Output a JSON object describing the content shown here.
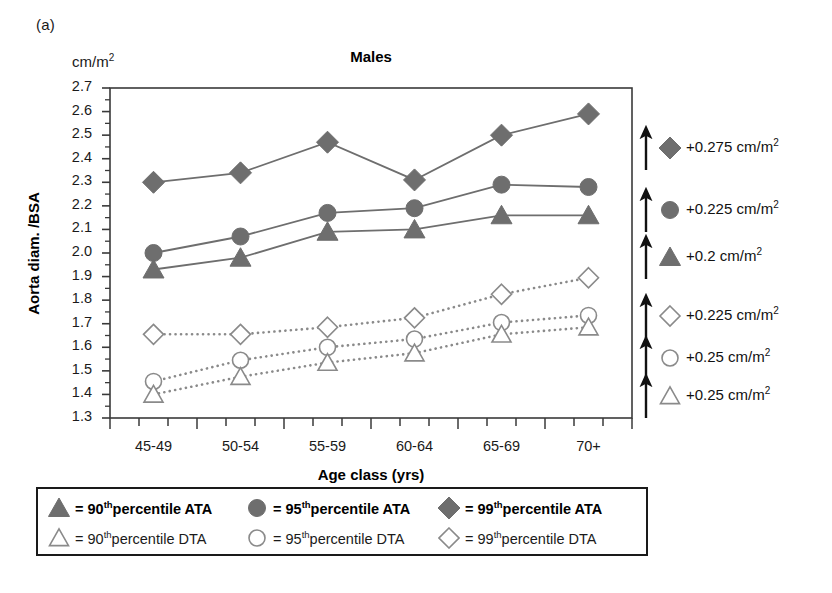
{
  "panel": {
    "label": "(a)"
  },
  "axes": {
    "unit_label": "cm/m",
    "unit_exponent": "2",
    "y_axis_title": "Aorta diam. /BSA",
    "x_axis_title": "Age class (yrs)"
  },
  "annotations": [
    {
      "marker": "diamond-filled",
      "text": "+0.275 cm/m",
      "exponent": "2",
      "arrow": "up-arrow-icon"
    },
    {
      "marker": "circle-filled",
      "text": "+0.225 cm/m",
      "exponent": "2",
      "arrow": "up-arrow-icon"
    },
    {
      "marker": "triangle-filled",
      "text": "+0.2 cm/m",
      "exponent": "2",
      "arrow": "up-arrow-icon"
    },
    {
      "marker": "diamond-open",
      "text": "+0.225 cm/m",
      "exponent": "2",
      "arrow": "up-arrow-icon"
    },
    {
      "marker": "circle-open",
      "text": "+0.25 cm/m",
      "exponent": "2",
      "arrow": "up-arrow-icon"
    },
    {
      "marker": "triangle-open",
      "text": "+0.25 cm/m",
      "exponent": "2",
      "arrow": "up-arrow-icon"
    }
  ],
  "legend": {
    "rows": [
      [
        {
          "marker": "triangle-filled",
          "eq": "=",
          "num": "90",
          "sup": "th",
          "rest": "percentile ATA"
        },
        {
          "marker": "circle-filled",
          "eq": "=",
          "num": "95",
          "sup": "th",
          "rest": "percentile ATA"
        },
        {
          "marker": "diamond-filled",
          "eq": "=",
          "num": "99",
          "sup": "th",
          "rest": "percentile ATA"
        }
      ],
      [
        {
          "marker": "triangle-open",
          "eq": "=",
          "num": "90",
          "sup": "th",
          "rest": "percentile DTA"
        },
        {
          "marker": "circle-open",
          "eq": "=",
          "num": "95",
          "sup": "th",
          "rest": "percentile DTA"
        },
        {
          "marker": "diamond-open",
          "eq": "=",
          "num": "99",
          "sup": "th",
          "rest": "percentile DTA"
        }
      ]
    ]
  },
  "colors": {
    "filled_marker": "#6e6e6e",
    "solid_line": "#6e6e6e",
    "open_marker_stroke": "#8a8a8a",
    "dotted_line": "#8a8a8a",
    "axis": "#3a3a3a",
    "text": "#111111"
  },
  "chart_data": {
    "type": "line",
    "title": "Males",
    "xlabel": "Age class (yrs)",
    "ylabel": "Aorta diam. /BSA",
    "yunit": "cm/m2",
    "categories": [
      "45-49",
      "50-54",
      "55-59",
      "60-64",
      "65-69",
      "70+"
    ],
    "ylim": [
      1.3,
      2.7
    ],
    "ytick_labels": [
      "2.7",
      "2.6",
      "2.5",
      "2.4",
      "2.3",
      "2.2",
      "2.1",
      "2.0",
      "1.9",
      "1.8",
      "1.7",
      "1.6",
      "1.5",
      "1.4",
      "1.3"
    ],
    "ytick_values": [
      2.7,
      2.6,
      2.5,
      2.4,
      2.3,
      2.2,
      2.1,
      2.0,
      1.9,
      1.8,
      1.7,
      1.6,
      1.5,
      1.4,
      1.3
    ],
    "minor_tick_step": 0.05,
    "grid": false,
    "legend_position": "below-plot",
    "series": [
      {
        "name": "99th percentile ATA",
        "marker": "diamond-filled",
        "line": "solid",
        "values": [
          2.3,
          2.34,
          2.47,
          2.31,
          2.5,
          2.59
        ]
      },
      {
        "name": "95th percentile ATA",
        "marker": "circle-filled",
        "line": "solid",
        "values": [
          2.0,
          2.07,
          2.17,
          2.19,
          2.29,
          2.28
        ]
      },
      {
        "name": "90th percentile ATA",
        "marker": "triangle-filled",
        "line": "solid",
        "values": [
          1.93,
          1.98,
          2.09,
          2.1,
          2.16,
          2.16
        ]
      },
      {
        "name": "99th percentile DTA",
        "marker": "diamond-open",
        "line": "dotted",
        "values": [
          1.655,
          1.655,
          1.685,
          1.725,
          1.825,
          1.895
        ]
      },
      {
        "name": "95th percentile DTA",
        "marker": "circle-open",
        "line": "dotted",
        "values": [
          1.455,
          1.545,
          1.6,
          1.635,
          1.705,
          1.735
        ]
      },
      {
        "name": "90th percentile DTA",
        "marker": "triangle-open",
        "line": "dotted",
        "values": [
          1.4,
          1.475,
          1.535,
          1.575,
          1.655,
          1.685
        ]
      }
    ],
    "annotations": [
      "+0.275 cm/m2",
      "+0.225 cm/m2",
      "+0.2 cm/m2",
      "+0.225 cm/m2",
      "+0.25 cm/m2",
      "+0.25 cm/m2"
    ]
  }
}
